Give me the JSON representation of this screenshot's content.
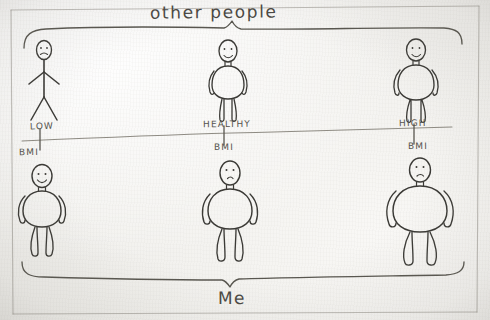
{
  "drawing": {
    "medium": "pencil-on-paper",
    "top_brace_label": "other people",
    "bottom_brace_label": "Me",
    "axis": {
      "name": "BMI",
      "ticks": [
        {
          "level": "LOW",
          "unit": "BMI"
        },
        {
          "level": "HEALTHY",
          "unit": "BMI"
        },
        {
          "level": "HIGH",
          "unit": "BMI"
        }
      ]
    },
    "rows": [
      {
        "group": "other people",
        "figures": [
          {
            "position": "left",
            "build": "very-thin stick figure",
            "expression": "frown"
          },
          {
            "position": "middle",
            "build": "average oval torso",
            "expression": "smile"
          },
          {
            "position": "right",
            "build": "average oval torso",
            "expression": "smile"
          }
        ]
      },
      {
        "group": "Me",
        "figures": [
          {
            "position": "left",
            "build": "medium rounded torso",
            "expression": "smile"
          },
          {
            "position": "middle",
            "build": "wide rounded torso",
            "expression": "neutral"
          },
          {
            "position": "right",
            "build": "widest rounded torso",
            "expression": "neutral"
          }
        ]
      }
    ],
    "colors": {
      "paper": "#f4f3f1",
      "ink": "#3b3a36",
      "ink_soft": "#58564f",
      "ink_faint": "#8e8b83"
    }
  }
}
